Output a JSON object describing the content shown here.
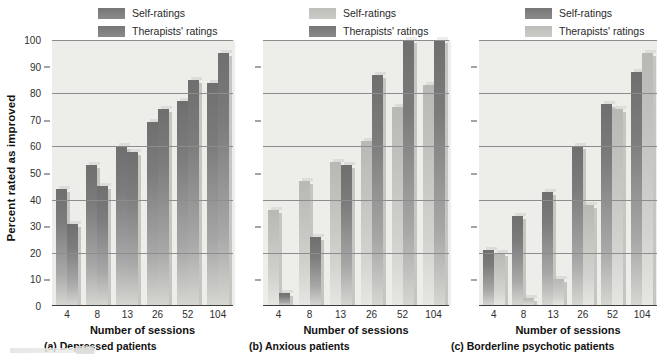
{
  "figure": {
    "ylabel": "Percent rated as improved",
    "xlabel": "Number of sessions",
    "y_ticks": [
      "100",
      "90",
      "80",
      "70",
      "60",
      "50",
      "40",
      "30",
      "20",
      "10",
      "0"
    ],
    "x_ticks": [
      "4",
      "8",
      "13",
      "26",
      "52",
      "104"
    ],
    "colors": {
      "dark_gray": "#7c7c7c",
      "light_gray": "#c2c2bf",
      "plot_background": "#ededea",
      "gridline": "#8d8d8d",
      "text": "#111111"
    }
  },
  "panels": [
    {
      "caption": "(a) Depressed patients",
      "xlabel": "Number of sessions",
      "legend": [
        {
          "label": "Self-ratings",
          "tone": "dark"
        },
        {
          "label": "Therapists' ratings",
          "tone": "dark"
        }
      ]
    },
    {
      "caption": "(b) Anxious patients",
      "xlabel": "Number of sessions",
      "legend": [
        {
          "label": "Self-ratings",
          "tone": "light"
        },
        {
          "label": "Therapists' ratings",
          "tone": "dark"
        }
      ]
    },
    {
      "caption": "(c) Borderline psychotic patients",
      "xlabel": "Number of sessions",
      "legend": [
        {
          "label": "Self-ratings",
          "tone": "dark"
        },
        {
          "label": "Therapists' ratings",
          "tone": "light"
        }
      ]
    }
  ],
  "chart_data": [
    {
      "type": "bar",
      "title": "(a) Depressed patients",
      "xlabel": "Number of sessions",
      "ylabel": "Percent rated as improved",
      "ylim": [
        0,
        100
      ],
      "grid": true,
      "legend_position": "above-plot",
      "categories": [
        "4",
        "8",
        "13",
        "26",
        "52",
        "104"
      ],
      "series": [
        {
          "name": "Self-ratings",
          "tone": "dark",
          "values": [
            44,
            53,
            60,
            69,
            77,
            84
          ]
        },
        {
          "name": "Therapists' ratings",
          "tone": "dark",
          "values": [
            31,
            45,
            58,
            74,
            85,
            95
          ]
        }
      ]
    },
    {
      "type": "bar",
      "title": "(b) Anxious patients",
      "xlabel": "Number of sessions",
      "ylabel": "Percent rated as improved",
      "ylim": [
        0,
        100
      ],
      "grid": true,
      "legend_position": "above-plot",
      "categories": [
        "4",
        "8",
        "13",
        "26",
        "52",
        "104"
      ],
      "series": [
        {
          "name": "Self-ratings",
          "tone": "light",
          "values": [
            36,
            47,
            54,
            62,
            75,
            83
          ]
        },
        {
          "name": "Therapists' ratings",
          "tone": "dark",
          "values": [
            5,
            26,
            53,
            87,
            100,
            100
          ]
        }
      ]
    },
    {
      "type": "bar",
      "title": "(c) Borderline psychotic patients",
      "xlabel": "Number of sessions",
      "ylabel": "Percent rated as improved",
      "ylim": [
        0,
        100
      ],
      "grid": true,
      "legend_position": "above-plot",
      "categories": [
        "4",
        "8",
        "13",
        "26",
        "52",
        "104"
      ],
      "series": [
        {
          "name": "Self-ratings",
          "tone": "dark",
          "values": [
            21,
            34,
            43,
            60,
            76,
            88
          ]
        },
        {
          "name": "Therapists' ratings",
          "tone": "light",
          "values": [
            20,
            3,
            10,
            38,
            74,
            95
          ]
        }
      ]
    }
  ]
}
